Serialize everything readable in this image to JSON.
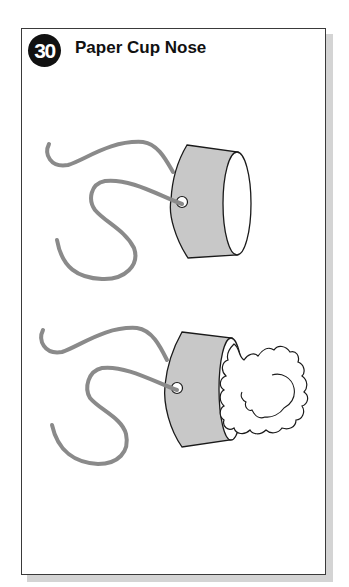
{
  "header": {
    "step_number": "30",
    "title": "Paper Cup Nose"
  },
  "illustrations": [
    {
      "name": "cup-with-string",
      "description": "Paper cup with elastic string threaded through a hole"
    },
    {
      "name": "cup-with-tissue",
      "description": "Paper cup with string and crumpled tissue stuffed in opening"
    }
  ],
  "colors": {
    "cup_fill": "#c8c8c8",
    "string": "#8a8a8a",
    "outline": "#1a1a1a",
    "badge": "#111111"
  }
}
